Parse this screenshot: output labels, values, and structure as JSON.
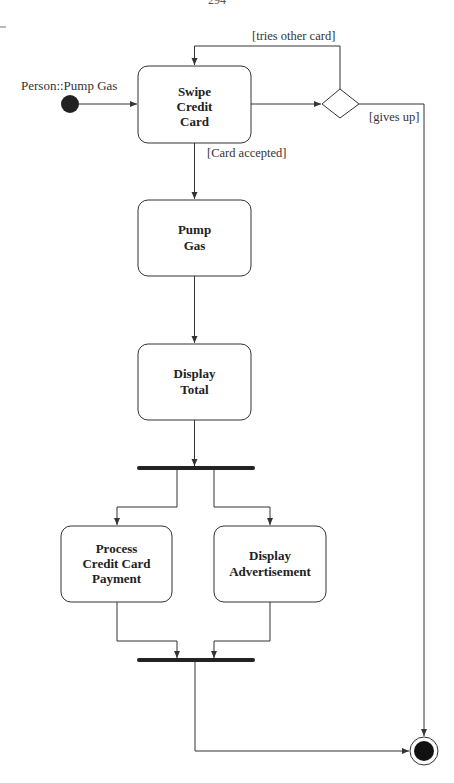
{
  "page": {
    "page_number": "294"
  },
  "diagram": {
    "type": "UML activity diagram",
    "title": "Person::Pump Gas",
    "initial_node": {
      "label": "Person::Pump Gas"
    },
    "activities": [
      {
        "id": "swipe",
        "label_lines": [
          "Swipe",
          "Credit",
          "Card"
        ]
      },
      {
        "id": "pump",
        "label_lines": [
          "Pump",
          "Gas"
        ]
      },
      {
        "id": "display_total",
        "label_lines": [
          "Display",
          "Total"
        ]
      },
      {
        "id": "process_payment",
        "label_lines": [
          "Process",
          "Credit Card",
          "Payment"
        ]
      },
      {
        "id": "display_ad",
        "label_lines": [
          "Display",
          "Advertisement"
        ]
      }
    ],
    "guards": {
      "tries_other": "[tries other card]",
      "gives_up": "[gives up]",
      "accepted": "[Card accepted]"
    },
    "flows": [
      {
        "from": "initial",
        "to": "swipe"
      },
      {
        "from": "swipe",
        "to": "decision"
      },
      {
        "from": "decision",
        "to": "swipe",
        "guard": "[tries other card]"
      },
      {
        "from": "decision",
        "to": "final",
        "guard": "[gives up]"
      },
      {
        "from": "swipe",
        "to": "pump",
        "guard": "[Card accepted]"
      },
      {
        "from": "pump",
        "to": "display_total"
      },
      {
        "from": "display_total",
        "to": "fork"
      },
      {
        "from": "fork",
        "to": "process_payment"
      },
      {
        "from": "fork",
        "to": "display_ad"
      },
      {
        "from": "process_payment",
        "to": "join"
      },
      {
        "from": "display_ad",
        "to": "join"
      },
      {
        "from": "join",
        "to": "final"
      }
    ]
  }
}
